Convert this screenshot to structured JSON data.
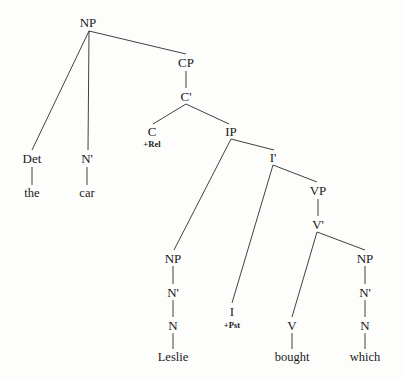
{
  "figure": {
    "kind": "syntax-tree",
    "sentence": "the car which Leslie bought",
    "background_color": "#fdfdfc",
    "line_color": "#2b2b2b"
  },
  "nodes": [
    {
      "id": "np-root",
      "label": "NP",
      "x": 88,
      "y": 22,
      "type": "category"
    },
    {
      "id": "det",
      "label": "Det",
      "x": 32,
      "y": 158,
      "type": "category"
    },
    {
      "id": "the",
      "label": "the",
      "x": 32,
      "y": 193,
      "type": "terminal"
    },
    {
      "id": "nbar-1",
      "label": "N'",
      "x": 87,
      "y": 158,
      "type": "category"
    },
    {
      "id": "car",
      "label": "car",
      "x": 87,
      "y": 193,
      "type": "terminal"
    },
    {
      "id": "cp",
      "label": "CP",
      "x": 186,
      "y": 62,
      "type": "category"
    },
    {
      "id": "cbar",
      "label": "C'",
      "x": 186,
      "y": 96,
      "type": "category"
    },
    {
      "id": "c",
      "label": "C",
      "x": 152,
      "y": 131,
      "type": "category"
    },
    {
      "id": "c-feature",
      "label": "+Rel",
      "x": 152,
      "y": 144,
      "type": "feature"
    },
    {
      "id": "ip",
      "label": "IP",
      "x": 231,
      "y": 131,
      "type": "category"
    },
    {
      "id": "ibar",
      "label": "I'",
      "x": 273,
      "y": 157,
      "type": "category"
    },
    {
      "id": "np-subj",
      "label": "NP",
      "x": 173,
      "y": 258,
      "type": "category"
    },
    {
      "id": "nbar-2",
      "label": "N'",
      "x": 173,
      "y": 292,
      "type": "category"
    },
    {
      "id": "n-2",
      "label": "N",
      "x": 173,
      "y": 325,
      "type": "category"
    },
    {
      "id": "leslie",
      "label": "Leslie",
      "x": 173,
      "y": 357,
      "type": "terminal"
    },
    {
      "id": "i",
      "label": "I",
      "x": 232,
      "y": 311,
      "type": "category"
    },
    {
      "id": "i-feature",
      "label": "+Pst",
      "x": 232,
      "y": 325,
      "type": "feature"
    },
    {
      "id": "vp",
      "label": "VP",
      "x": 318,
      "y": 190,
      "type": "category"
    },
    {
      "id": "vbar",
      "label": "V'",
      "x": 318,
      "y": 224,
      "type": "category"
    },
    {
      "id": "v",
      "label": "V",
      "x": 292,
      "y": 325,
      "type": "category"
    },
    {
      "id": "bought",
      "label": "bought",
      "x": 292,
      "y": 357,
      "type": "terminal"
    },
    {
      "id": "np-obj",
      "label": "NP",
      "x": 365,
      "y": 258,
      "type": "category"
    },
    {
      "id": "nbar-3",
      "label": "N'",
      "x": 365,
      "y": 292,
      "type": "category"
    },
    {
      "id": "n-3",
      "label": "N",
      "x": 365,
      "y": 325,
      "type": "category"
    },
    {
      "id": "which",
      "label": "which",
      "x": 365,
      "y": 357,
      "type": "terminal"
    }
  ],
  "edges": [
    {
      "from": "np-root",
      "to": "det",
      "x1": 89,
      "y1": 31,
      "x2": 32,
      "y2": 150
    },
    {
      "from": "np-root",
      "to": "nbar-1",
      "x1": 89,
      "y1": 31,
      "x2": 88,
      "y2": 150
    },
    {
      "from": "np-root",
      "to": "cp",
      "x1": 89,
      "y1": 31,
      "x2": 186,
      "y2": 54
    },
    {
      "from": "det",
      "to": "the",
      "x1": 32,
      "y1": 167,
      "x2": 32,
      "y2": 185
    },
    {
      "from": "nbar-1",
      "to": "car",
      "x1": 87,
      "y1": 167,
      "x2": 87,
      "y2": 185
    },
    {
      "from": "cp",
      "to": "cbar",
      "x1": 186,
      "y1": 71,
      "x2": 186,
      "y2": 88
    },
    {
      "from": "cbar",
      "to": "c",
      "x1": 186,
      "y1": 104,
      "x2": 153,
      "y2": 124
    },
    {
      "from": "cbar",
      "to": "ip",
      "x1": 186,
      "y1": 104,
      "x2": 229,
      "y2": 124
    },
    {
      "from": "ip",
      "to": "np-subj",
      "x1": 231,
      "y1": 139,
      "x2": 174,
      "y2": 250
    },
    {
      "from": "ip",
      "to": "ibar",
      "x1": 231,
      "y1": 139,
      "x2": 274,
      "y2": 150
    },
    {
      "from": "ibar",
      "to": "i",
      "x1": 273,
      "y1": 165,
      "x2": 232,
      "y2": 303
    },
    {
      "from": "ibar",
      "to": "vp",
      "x1": 273,
      "y1": 165,
      "x2": 317,
      "y2": 182
    },
    {
      "from": "vp",
      "to": "vbar",
      "x1": 318,
      "y1": 199,
      "x2": 318,
      "y2": 216
    },
    {
      "from": "vbar",
      "to": "v",
      "x1": 317,
      "y1": 232,
      "x2": 292,
      "y2": 317
    },
    {
      "from": "vbar",
      "to": "np-obj",
      "x1": 317,
      "y1": 232,
      "x2": 365,
      "y2": 250
    },
    {
      "from": "np-subj",
      "to": "nbar-2",
      "x1": 173,
      "y1": 266,
      "x2": 173,
      "y2": 284
    },
    {
      "from": "nbar-2",
      "to": "n-2",
      "x1": 173,
      "y1": 300,
      "x2": 173,
      "y2": 317
    },
    {
      "from": "n-2",
      "to": "leslie",
      "x1": 173,
      "y1": 333,
      "x2": 173,
      "y2": 349
    },
    {
      "from": "v",
      "to": "bought",
      "x1": 292,
      "y1": 333,
      "x2": 292,
      "y2": 349
    },
    {
      "from": "np-obj",
      "to": "nbar-3",
      "x1": 365,
      "y1": 266,
      "x2": 365,
      "y2": 284
    },
    {
      "from": "nbar-3",
      "to": "n-3",
      "x1": 365,
      "y1": 300,
      "x2": 365,
      "y2": 317
    },
    {
      "from": "n-3",
      "to": "which",
      "x1": 365,
      "y1": 333,
      "x2": 365,
      "y2": 349
    }
  ]
}
